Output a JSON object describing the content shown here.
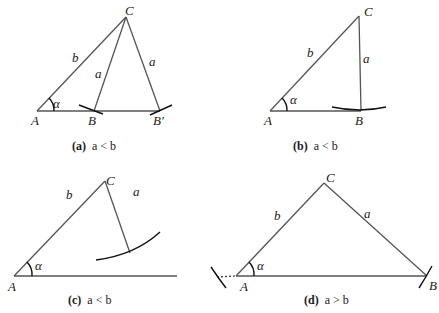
{
  "figures": [
    {
      "id": "a",
      "caption_tag": "(a)",
      "caption_rel": "a < b",
      "vertices": {
        "A": "A",
        "B": "B",
        "B2": "B′",
        "C": "C"
      },
      "sides": {
        "b": "b",
        "a1": "a",
        "a2": "a"
      },
      "angle": "α"
    },
    {
      "id": "b",
      "caption_tag": "(b)",
      "caption_rel": "a < b",
      "vertices": {
        "A": "A",
        "B": "B",
        "C": "C"
      },
      "sides": {
        "b": "b",
        "a": "a"
      },
      "angle": "α"
    },
    {
      "id": "c",
      "caption_tag": "(c)",
      "caption_rel": "a < b",
      "vertices": {
        "A": "A",
        "C": "C"
      },
      "sides": {
        "b": "b",
        "a": "a"
      },
      "angle": "α"
    },
    {
      "id": "d",
      "caption_tag": "(d)",
      "caption_rel": "a > b",
      "vertices": {
        "A": "A",
        "B": "B",
        "C": "C"
      },
      "sides": {
        "b": "b",
        "a": "a"
      },
      "angle": "α"
    }
  ]
}
